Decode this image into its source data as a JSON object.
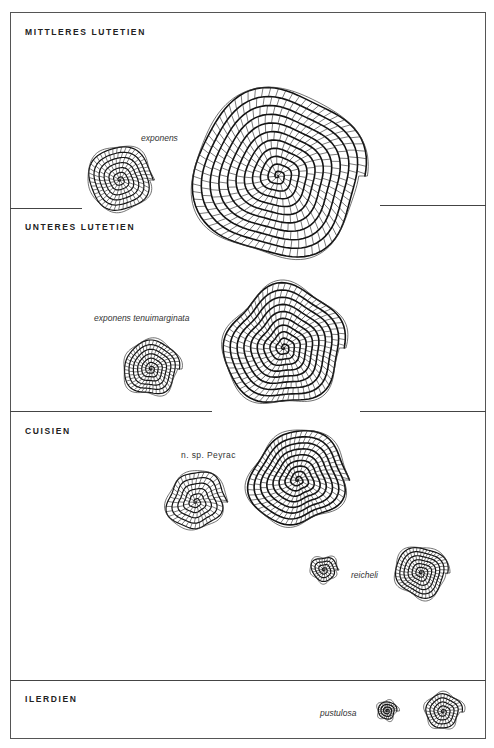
{
  "figure": {
    "stages": [
      {
        "id": "mittleres-lutetien",
        "label": "MITTLERES LUTETIEN"
      },
      {
        "id": "unteres-lutetien",
        "label": "UNTERES LUTETIEN"
      },
      {
        "id": "cuisien",
        "label": "CUISIEN"
      },
      {
        "id": "ilerdien",
        "label": "ILERDIEN"
      }
    ],
    "species": [
      {
        "id": "exponens",
        "label": "exponens",
        "stage": "MITTLERES LUTETIEN"
      },
      {
        "id": "exponens-tenuimarginata",
        "label": "exponens tenuimarginata",
        "stage": "UNTERES LUTETIEN"
      },
      {
        "id": "n-sp-peyrac",
        "label": "n. sp. Peyrac",
        "stage": "CUISIEN"
      },
      {
        "id": "reicheli",
        "label": "reicheli",
        "stage": "CUISIEN"
      },
      {
        "id": "pustulosa",
        "label": "pustulosa",
        "stage": "ILERDIEN"
      }
    ],
    "specimens": [
      {
        "species": "exponens",
        "form": "small",
        "cx": 120,
        "cy": 180,
        "r": 34,
        "whorls": 7
      },
      {
        "species": "exponens",
        "form": "large",
        "cx": 278,
        "cy": 176,
        "r": 88,
        "whorls": 11
      },
      {
        "species": "exponens tenuimarginata",
        "form": "small",
        "cx": 151,
        "cy": 369,
        "r": 29,
        "whorls": 7
      },
      {
        "species": "exponens tenuimarginata",
        "form": "large",
        "cx": 284,
        "cy": 348,
        "r": 62,
        "whorls": 10
      },
      {
        "species": "n. sp. Peyrac",
        "form": "small",
        "cx": 196,
        "cy": 502,
        "r": 31,
        "whorls": 6
      },
      {
        "species": "n. sp. Peyrac",
        "form": "large",
        "cx": 298,
        "cy": 480,
        "r": 50,
        "whorls": 9
      },
      {
        "species": "reicheli",
        "form": "small",
        "cx": 324,
        "cy": 570,
        "r": 14,
        "whorls": 4
      },
      {
        "species": "reicheli",
        "form": "large",
        "cx": 421,
        "cy": 573,
        "r": 27,
        "whorls": 7
      },
      {
        "species": "pustulosa",
        "form": "small",
        "cx": 387,
        "cy": 711,
        "r": 10,
        "whorls": 4
      },
      {
        "species": "pustulosa",
        "form": "large",
        "cx": 443,
        "cy": 712,
        "r": 19,
        "whorls": 5
      }
    ]
  }
}
